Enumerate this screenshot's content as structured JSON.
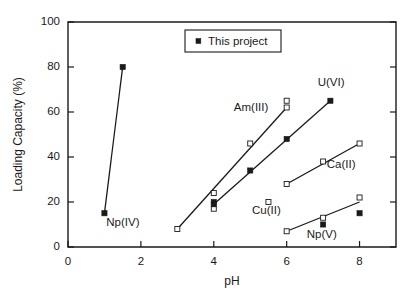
{
  "chart_data": {
    "type": "scatter",
    "title": "",
    "xlabel": "pH",
    "ylabel": "Loading Capacity (%)",
    "xlim": [
      0,
      9
    ],
    "ylim": [
      0,
      100
    ],
    "xticks": [
      "0",
      "2",
      "4",
      "6",
      "8"
    ],
    "xtick_values": [
      0,
      2,
      4,
      6,
      8
    ],
    "yticks": [
      "0",
      "20",
      "40",
      "60",
      "80",
      "100"
    ],
    "ytick_values": [
      0,
      20,
      40,
      60,
      80,
      100
    ],
    "grid": false,
    "legend_position": "top-center",
    "legend": [
      {
        "label": "This project",
        "marker": "filled-square"
      }
    ],
    "marker_note": "filled squares = this project; open squares = literature data",
    "series": [
      {
        "name": "Np(IV)",
        "label": "Np(IV)",
        "label_x": 1.05,
        "label_y": 9.5,
        "line": [
          [
            1.0,
            15
          ],
          [
            1.5,
            80
          ]
        ],
        "filled_points": [
          [
            1.0,
            15
          ],
          [
            1.5,
            80
          ]
        ],
        "open_points": []
      },
      {
        "name": "Am(III)",
        "label": "Am(III)",
        "label_x": 4.55,
        "label_y": 60.5,
        "line": [
          [
            3.0,
            8
          ],
          [
            6.0,
            62
          ]
        ],
        "filled_points": [],
        "open_points": [
          [
            3.0,
            8
          ],
          [
            4.0,
            24
          ],
          [
            5.0,
            46
          ],
          [
            6.0,
            65
          ],
          [
            6.0,
            62
          ]
        ]
      },
      {
        "name": "U(VI)",
        "label": "U(VI)",
        "label_x": 6.85,
        "label_y": 71.5,
        "line": [
          [
            4.0,
            19
          ],
          [
            7.2,
            65
          ]
        ],
        "filled_points": [
          [
            4.0,
            20
          ],
          [
            4.0,
            19
          ],
          [
            5.0,
            34
          ],
          [
            6.0,
            48
          ],
          [
            7.2,
            65
          ]
        ],
        "open_points": [
          [
            4.0,
            17
          ]
        ]
      },
      {
        "name": "Ca(II)",
        "label": "Ca(II)",
        "label_x": 7.1,
        "label_y": 35.0,
        "line": [
          [
            6.0,
            28
          ],
          [
            8.0,
            46
          ]
        ],
        "filled_points": [],
        "open_points": [
          [
            6.0,
            28
          ],
          [
            7.0,
            38
          ],
          [
            8.0,
            46
          ]
        ]
      },
      {
        "name": "Cu(II)",
        "label": "Cu(II)",
        "label_x": 5.05,
        "label_y": 14.5,
        "line": [],
        "filled_points": [],
        "open_points": [
          [
            5.5,
            20
          ]
        ]
      },
      {
        "name": "Np(V)",
        "label": "Np(V)",
        "label_x": 6.55,
        "label_y": 4.0,
        "line": [
          [
            6.0,
            7
          ],
          [
            8.0,
            20
          ]
        ],
        "filled_points": [
          [
            7.0,
            10
          ],
          [
            8.0,
            15
          ]
        ],
        "open_points": [
          [
            6.0,
            7
          ],
          [
            7.0,
            13
          ],
          [
            8.0,
            22
          ]
        ]
      }
    ]
  },
  "colors": {
    "foreground": "#1a1a1a",
    "background": "#ffffff"
  }
}
